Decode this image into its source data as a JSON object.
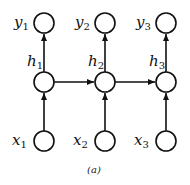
{
  "diagram": {
    "caption": "(a)",
    "nodes": {
      "outputs": [
        {
          "var": "y",
          "sub": "1"
        },
        {
          "var": "y",
          "sub": "2"
        },
        {
          "var": "y",
          "sub": "3"
        }
      ],
      "hidden": [
        {
          "var": "h",
          "sub": "1"
        },
        {
          "var": "h",
          "sub": "2"
        },
        {
          "var": "h",
          "sub": "3"
        }
      ],
      "inputs": [
        {
          "var": "x",
          "sub": "1"
        },
        {
          "var": "x",
          "sub": "2"
        },
        {
          "var": "x",
          "sub": "3"
        }
      ]
    },
    "edges": [
      "x1->h1",
      "x2->h2",
      "x3->h3",
      "h1->y1",
      "h2->y2",
      "h3->y3",
      "h1->h2",
      "h2->h3"
    ]
  }
}
